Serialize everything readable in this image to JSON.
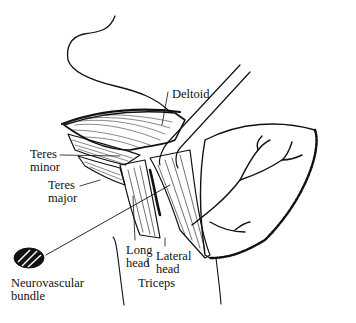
{
  "figure": {
    "labels": {
      "deltoid": "Deltoid",
      "teres_minor_1": "Teres",
      "teres_minor_2": "minor",
      "teres_major_1": "Teres",
      "teres_major_2": "major",
      "long_head_1": "Long",
      "long_head_2": "head",
      "lateral_head_1": "Lateral",
      "lateral_head_2": "head",
      "triceps": "Triceps",
      "neurovascular_1": "Neurovascular",
      "neurovascular_2": "bundle"
    },
    "colors": {
      "ink": "#111111",
      "background": "#ffffff"
    }
  }
}
